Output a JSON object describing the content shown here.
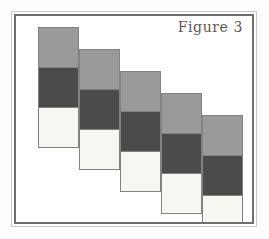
{
  "figure": {
    "label": "Figure 3",
    "background_color": "#ffffff",
    "page_color": "#fdfdfd",
    "frame": {
      "outer_color": "#c9c9c9",
      "inner_color": "#6e6e6e",
      "style": "double-rule rectangle"
    },
    "caption_color": "#585858"
  },
  "chart_data": {
    "type": "heatmap",
    "title": "Figure 3",
    "xlabel": "",
    "ylabel": "",
    "grid": false,
    "legend": false,
    "cell_size": 41,
    "column_step_x": 41,
    "column_step_y": 22,
    "palette": {
      "medium_gray": "#9a9a9a",
      "dark_gray": "#4b4b4b",
      "off_white": "#f6f6f3",
      "cell_border": "#828282"
    },
    "categories": [
      "Column 1",
      "Column 2",
      "Column 3",
      "Column 4",
      "Column 5"
    ],
    "row_labels": [
      "Top",
      "Middle",
      "Bottom"
    ],
    "series": [
      {
        "name": "Top",
        "values": [
          "medium_gray",
          "medium_gray",
          "medium_gray",
          "medium_gray",
          "medium_gray"
        ]
      },
      {
        "name": "Middle",
        "values": [
          "dark_gray",
          "dark_gray",
          "dark_gray",
          "dark_gray",
          "dark_gray"
        ]
      },
      {
        "name": "Bottom",
        "values": [
          "off_white",
          "off_white",
          "off_white",
          "off_white",
          "off_white"
        ]
      }
    ],
    "columns": [
      {
        "index": 1,
        "x": 22,
        "y": 11,
        "cells": [
          {
            "row": "Top",
            "color": "#9a9a9a"
          },
          {
            "row": "Middle",
            "color": "#4b4b4b"
          },
          {
            "row": "Bottom",
            "color": "#f6f6f3"
          }
        ]
      },
      {
        "index": 2,
        "x": 63,
        "y": 33,
        "cells": [
          {
            "row": "Top",
            "color": "#9a9a9a"
          },
          {
            "row": "Middle",
            "color": "#4b4b4b"
          },
          {
            "row": "Bottom",
            "color": "#f6f6f3"
          }
        ]
      },
      {
        "index": 3,
        "x": 104,
        "y": 55,
        "cells": [
          {
            "row": "Top",
            "color": "#9a9a9a"
          },
          {
            "row": "Middle",
            "color": "#4b4b4b"
          },
          {
            "row": "Bottom",
            "color": "#f6f6f3"
          }
        ]
      },
      {
        "index": 4,
        "x": 145,
        "y": 77,
        "cells": [
          {
            "row": "Top",
            "color": "#9a9a9a"
          },
          {
            "row": "Middle",
            "color": "#4b4b4b"
          },
          {
            "row": "Bottom",
            "color": "#f6f6f3"
          }
        ]
      },
      {
        "index": 5,
        "x": 186,
        "y": 99,
        "cells": [
          {
            "row": "Top",
            "color": "#9a9a9a"
          },
          {
            "row": "Middle",
            "color": "#4b4b4b"
          },
          {
            "row": "Bottom",
            "color": "#f6f6f3"
          }
        ]
      }
    ]
  }
}
